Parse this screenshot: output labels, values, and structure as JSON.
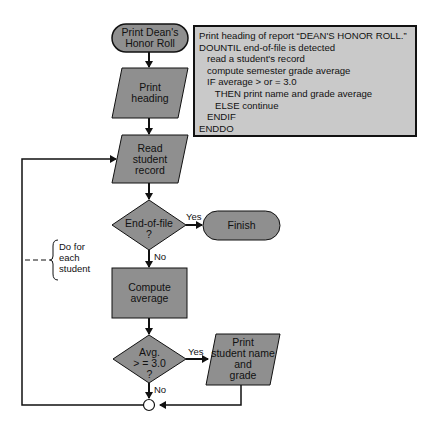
{
  "flowchart": {
    "start": {
      "line1": "Print Dean's",
      "line2": "Honor Roll"
    },
    "print_heading": {
      "line1": "Print",
      "line2": "heading"
    },
    "read_record": {
      "line1": "Read",
      "line2": "student",
      "line3": "record"
    },
    "eof_decision": {
      "line1": "End-of-file",
      "line2": "?",
      "yes": "Yes",
      "no": "No"
    },
    "finish": {
      "label": "Finish"
    },
    "compute": {
      "line1": "Compute",
      "line2": "average"
    },
    "avg_decision": {
      "line1": "Avg.",
      "line2": "> = 3.0",
      "line3": "?",
      "yes": "Yes",
      "no": "No"
    },
    "print_student": {
      "line1": "Print",
      "line2": "student name",
      "line3": "and",
      "line4": "grade"
    },
    "loop_note": {
      "line1": "Do for",
      "line2": "each",
      "line3": "student"
    }
  },
  "pseudocode": {
    "lines": [
      "Print heading of report “DEAN'S HONOR ROLL.”",
      "DOUNTIL end-of-file is detected",
      "   read a student's record",
      "   compute semester grade average",
      "   IF average > or = 3.0",
      "      THEN print name and grade average",
      "      ELSE continue",
      "   ENDIF",
      "ENDDO"
    ]
  },
  "colors": {
    "shape_fill": "#8f8f8f",
    "pseudocode_fill": "#c9c9c9",
    "stroke": "#111111"
  }
}
